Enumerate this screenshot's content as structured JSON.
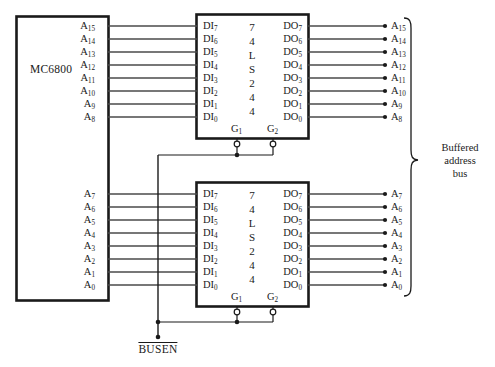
{
  "diagram": {
    "cpu": {
      "label": "MC6800",
      "high_address_pins": [
        "A15",
        "A14",
        "A13",
        "A12",
        "A11",
        "A10",
        "A9",
        "A8"
      ],
      "low_address_pins": [
        "A7",
        "A6",
        "A5",
        "A4",
        "A3",
        "A2",
        "A1",
        "A0"
      ]
    },
    "chips": [
      {
        "name": "upper-buffer",
        "part_number": "74LS244",
        "part_number_chars": [
          "7",
          "4",
          "L",
          "S",
          "2",
          "4",
          "4"
        ],
        "inputs": [
          "DI7",
          "DI6",
          "DI5",
          "DI4",
          "DI3",
          "DI2",
          "DI1",
          "DI0"
        ],
        "outputs": [
          "DO7",
          "DO6",
          "DO5",
          "DO4",
          "DO3",
          "DO2",
          "DO1",
          "DO0"
        ],
        "enables": [
          "G1",
          "G2"
        ],
        "enable_active_low": true,
        "source_pins": [
          "A15",
          "A14",
          "A13",
          "A12",
          "A11",
          "A10",
          "A9",
          "A8"
        ],
        "dest_pins": [
          "A15",
          "A14",
          "A13",
          "A12",
          "A11",
          "A10",
          "A9",
          "A8"
        ]
      },
      {
        "name": "lower-buffer",
        "part_number": "74LS244",
        "part_number_chars": [
          "7",
          "4",
          "L",
          "S",
          "2",
          "4",
          "4"
        ],
        "inputs": [
          "DI7",
          "DI6",
          "DI5",
          "DI4",
          "DI3",
          "DI2",
          "DI1",
          "DI0"
        ],
        "outputs": [
          "DO7",
          "DO6",
          "DO5",
          "DO4",
          "DO3",
          "DO2",
          "DO1",
          "DO0"
        ],
        "enables": [
          "G1",
          "G2"
        ],
        "enable_active_low": true,
        "source_pins": [
          "A7",
          "A6",
          "A5",
          "A4",
          "A3",
          "A2",
          "A1",
          "A0"
        ],
        "dest_pins": [
          "A7",
          "A6",
          "A5",
          "A4",
          "A3",
          "A2",
          "A1",
          "A0"
        ]
      }
    ],
    "bus_label": "Buffered address bus",
    "bus_label_lines": [
      "Buffered",
      "address",
      "bus"
    ],
    "control_signal": {
      "label": "BUSEN",
      "active_low": true
    },
    "colors": {
      "line": "#1a1a1a",
      "text": "#1a1a1a",
      "background": "#ffffff",
      "wire": "#555555"
    }
  }
}
